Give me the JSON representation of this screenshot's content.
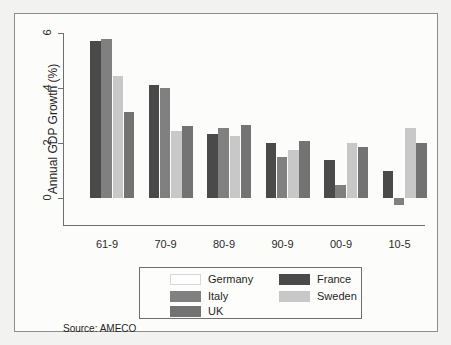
{
  "figure": {
    "source_note": "Source: AMECO"
  },
  "legend": {
    "entries": [
      {
        "label": "Germany",
        "color": "#ffffff",
        "border": "#d8d8d8",
        "col": 0,
        "row": 0
      },
      {
        "label": "Italy",
        "color": "#808080",
        "border": "#808080",
        "col": 0,
        "row": 1
      },
      {
        "label": "UK",
        "color": "#737373",
        "border": "#737373",
        "col": 0,
        "row": 2
      },
      {
        "label": "France",
        "color": "#4a4a4a",
        "border": "#4a4a4a",
        "col": 1,
        "row": 0
      },
      {
        "label": "Sweden",
        "color": "#c8c8c8",
        "border": "#c8c8c8",
        "col": 1,
        "row": 1
      }
    ]
  },
  "chart_data": {
    "type": "bar",
    "title": "",
    "xlabel": "",
    "ylabel": "Annual GDP Growth (%)",
    "ylim": [
      -1,
      6
    ],
    "yticks": [
      0,
      2,
      4,
      6
    ],
    "ytick_labels": [
      "0",
      "2",
      "4",
      "6"
    ],
    "grid": false,
    "legend_position": "below-axes",
    "categories": [
      "61-9",
      "70-9",
      "80-9",
      "90-9",
      "00-9",
      "10-5"
    ],
    "series": [
      {
        "name": "Germany",
        "color": "#ffffff",
        "values": [
          null,
          null,
          null,
          null,
          null,
          null
        ]
      },
      {
        "name": "France",
        "color": "#4a4a4a",
        "values": [
          5.7,
          4.1,
          2.35,
          2.0,
          1.4,
          1.0
        ]
      },
      {
        "name": "Italy",
        "color": "#808080",
        "values": [
          5.78,
          4.0,
          2.55,
          1.5,
          0.5,
          -0.25
        ]
      },
      {
        "name": "Sweden",
        "color": "#c8c8c8",
        "values": [
          4.45,
          2.45,
          2.28,
          1.75,
          2.0,
          2.55
        ]
      },
      {
        "name": "UK",
        "color": "#737373",
        "values": [
          3.12,
          2.62,
          2.65,
          2.1,
          1.85,
          2.0
        ]
      }
    ]
  }
}
